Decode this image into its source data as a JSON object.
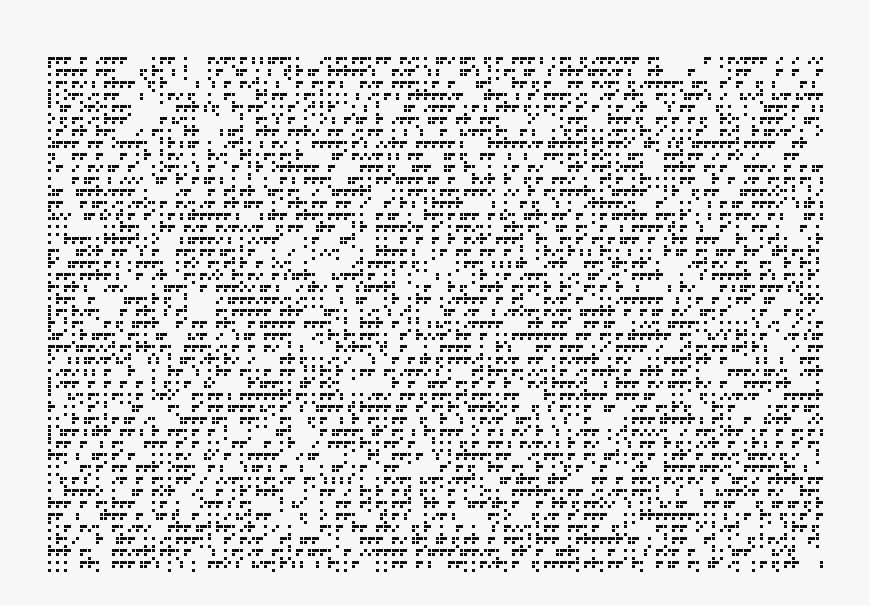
{
  "image": {
    "description": "Black-on-white pixel pattern of glyph-like tiles (corner hooks, toothed horizontal bars, dotted vertical columns)",
    "background_color": "#f7f7f5",
    "ink_color": "#111111",
    "pattern_bounds": {
      "x": 48,
      "y": 57,
      "width": 778,
      "height": 511
    },
    "cell_size": 4,
    "seed": 1987
  }
}
